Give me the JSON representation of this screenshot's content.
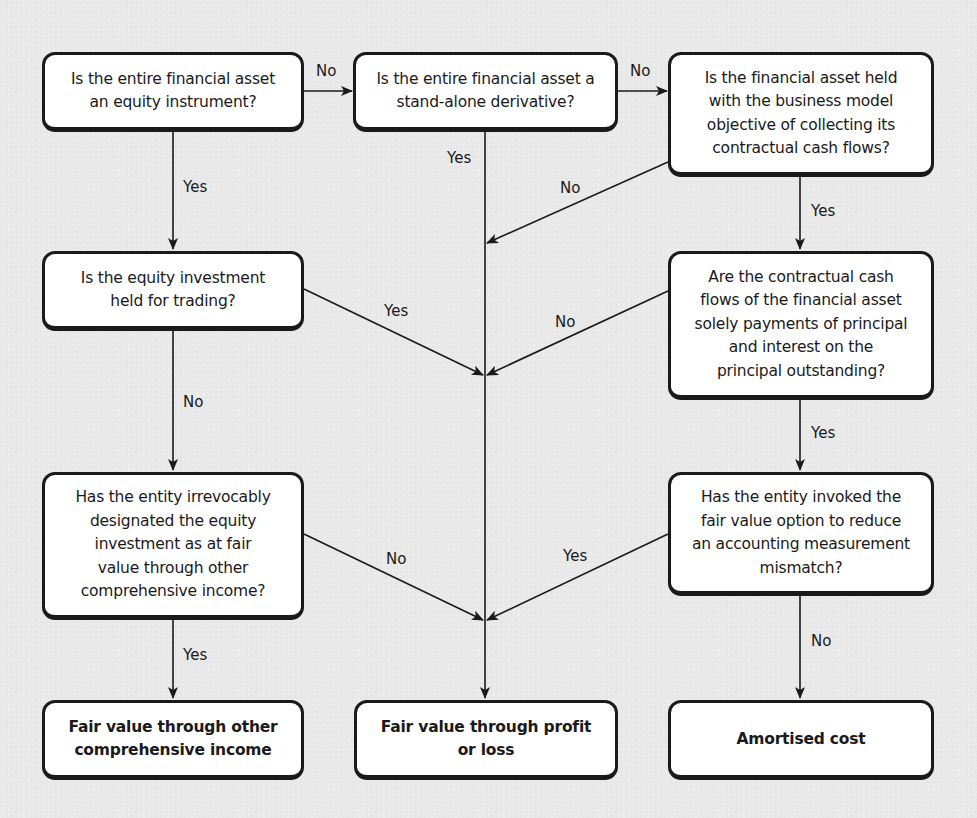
{
  "diagram": {
    "type": "flowchart",
    "nodes": {
      "q_equity": "Is the entire financial asset\nan equity instrument?",
      "q_derivative": "Is the entire financial asset a\nstand-alone derivative?",
      "q_business_model": "Is the financial asset held\nwith the business model\nobjective of collecting its\ncontractual cash flows?",
      "q_trading": "Is the equity investment\nheld for trading?",
      "q_sppi": "Are the contractual cash\nflows of the financial asset\nsolely payments of principal\nand interest on the\nprincipal outstanding?",
      "q_fvoci_designation": "Has the entity irrevocably\ndesignated the equity\ninvestment as at fair\nvalue through other\ncomprehensive income?",
      "q_fvo": "Has the entity invoked the\nfair value option to reduce\nan accounting measurement\nmismatch?",
      "o_fvoci": "Fair value through other\ncomprehensive income",
      "o_fvtpl": "Fair value through profit\nor loss",
      "o_amortised": "Amortised cost"
    },
    "edge_labels": {
      "equity_no": "No",
      "equity_yes": "Yes",
      "derivative_no": "No",
      "derivative_yes": "Yes",
      "business_model_no": "No",
      "business_model_yes": "Yes",
      "trading_yes": "Yes",
      "trading_no": "No",
      "sppi_no": "No",
      "sppi_yes": "Yes",
      "fvoci_no": "No",
      "fvoci_yes": "Yes",
      "fvo_yes": "Yes",
      "fvo_no": "No"
    },
    "edges": [
      {
        "from": "q_equity",
        "to": "q_derivative",
        "label": "No"
      },
      {
        "from": "q_equity",
        "to": "q_trading",
        "label": "Yes"
      },
      {
        "from": "q_derivative",
        "to": "q_business_model",
        "label": "No"
      },
      {
        "from": "q_derivative",
        "to": "o_fvtpl",
        "label": "Yes"
      },
      {
        "from": "q_business_model",
        "to": "o_fvtpl",
        "label": "No"
      },
      {
        "from": "q_business_model",
        "to": "q_sppi",
        "label": "Yes"
      },
      {
        "from": "q_trading",
        "to": "o_fvtpl",
        "label": "Yes"
      },
      {
        "from": "q_trading",
        "to": "q_fvoci_designation",
        "label": "No"
      },
      {
        "from": "q_sppi",
        "to": "o_fvtpl",
        "label": "No"
      },
      {
        "from": "q_sppi",
        "to": "q_fvo",
        "label": "Yes"
      },
      {
        "from": "q_fvoci_designation",
        "to": "o_fvtpl",
        "label": "No"
      },
      {
        "from": "q_fvoci_designation",
        "to": "o_fvoci",
        "label": "Yes"
      },
      {
        "from": "q_fvo",
        "to": "o_fvtpl",
        "label": "Yes"
      },
      {
        "from": "q_fvo",
        "to": "o_amortised",
        "label": "No"
      }
    ],
    "colors": {
      "background": "#e9e9e9",
      "box_fill": "#ffffff",
      "stroke": "#1a1a1a"
    }
  }
}
